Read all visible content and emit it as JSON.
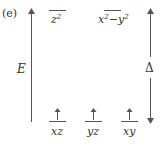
{
  "panel_label": "(e)",
  "energy_axis": {
    "label": "E",
    "direction": "up"
  },
  "splitting": {
    "label": "Δ",
    "direction": "both"
  },
  "upper_levels": [
    {
      "orbital": "z",
      "sup": "2",
      "electrons": 0
    },
    {
      "orbital": "x",
      "sup": "2",
      "mid": "−y",
      "sup2": "2",
      "electrons": 0
    }
  ],
  "lower_levels": [
    {
      "orbital": "xz",
      "electrons": 1,
      "spin": "up"
    },
    {
      "orbital": "yz",
      "electrons": 1,
      "spin": "up"
    },
    {
      "orbital": "xy",
      "electrons": 1,
      "spin": "up"
    }
  ],
  "colors": {
    "line": "#555555",
    "text": "#333333"
  }
}
